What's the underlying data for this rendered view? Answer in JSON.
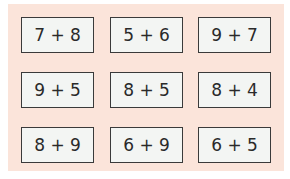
{
  "cards": [
    {
      "expr": "7 + 8"
    },
    {
      "expr": "5 + 6"
    },
    {
      "expr": "9 + 7"
    },
    {
      "expr": "9 + 5"
    },
    {
      "expr": "8 + 5"
    },
    {
      "expr": "8 + 4"
    },
    {
      "expr": "8 + 9"
    },
    {
      "expr": "6 + 9"
    },
    {
      "expr": "6 + 5"
    }
  ]
}
